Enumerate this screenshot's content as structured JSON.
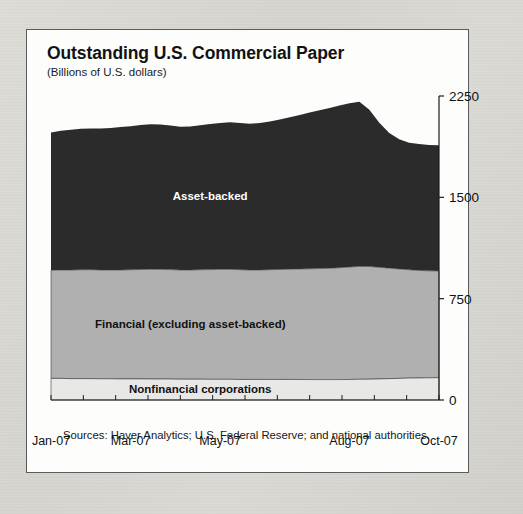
{
  "panel": {
    "title": "Outstanding U.S. Commercial Paper",
    "subtitle": "(Billions of U.S. dollars)",
    "source": "Sources: Haver Analytics; U.S. Federal Reserve; and national authorities."
  },
  "labels": {
    "asset_backed": "Asset-backed",
    "financial": "Financial (excluding asset-backed)",
    "nonfinancial": "Nonfinancial corporations"
  },
  "colors": {
    "asset_backed": "#2b2b2b",
    "financial": "#b0b0b0",
    "nonfinancial": "#e8e8e6",
    "axis": "#1d1d1d",
    "panel_background": "#fdfdfc",
    "page_background": "#d9d7d2"
  },
  "chart_data": {
    "type": "area",
    "stacked": true,
    "title": "Outstanding U.S. Commercial Paper",
    "subtitle": "(Billions of U.S. dollars)",
    "xlabel": "",
    "ylabel": "Billions of U.S. dollars",
    "ylim": [
      0,
      2250
    ],
    "yticks": [
      0,
      750,
      1500,
      2250
    ],
    "ytick_labels": [
      "0",
      "750",
      "1500",
      "2250"
    ],
    "y_axis_position": "right",
    "grid": false,
    "legend": "inline-band-labels",
    "xticks": [
      "Jan-07",
      "Mar-07",
      "May-07",
      "Aug-07",
      "Oct-07"
    ],
    "xtick_positions": [
      0,
      8,
      17,
      30,
      39
    ],
    "x": [
      "Jan-07 w1",
      "Jan-07 w2",
      "Jan-07 w3",
      "Jan-07 w4",
      "Feb-07 w1",
      "Feb-07 w2",
      "Feb-07 w3",
      "Feb-07 w4",
      "Mar-07 w1",
      "Mar-07 w2",
      "Mar-07 w3",
      "Mar-07 w4",
      "Apr-07 w1",
      "Apr-07 w2",
      "Apr-07 w3",
      "Apr-07 w4",
      "May-07 w1",
      "May-07 w2",
      "May-07 w3",
      "May-07 w4",
      "Jun-07 w1",
      "Jun-07 w2",
      "Jun-07 w3",
      "Jun-07 w4",
      "Jul-07 w1",
      "Jul-07 w2",
      "Jul-07 w3",
      "Jul-07 w4",
      "Aug-07 w1",
      "Aug-07 w2",
      "Aug-07 w3",
      "Aug-07 w4",
      "Sep-07 w1",
      "Sep-07 w2",
      "Sep-07 w3",
      "Sep-07 w4",
      "Oct-07 w1",
      "Oct-07 w2",
      "Oct-07 w3",
      "Oct-07 w4"
    ],
    "series": [
      {
        "name": "Nonfinancial corporations",
        "color": "#e8e8e6",
        "values": [
          160,
          160,
          158,
          158,
          158,
          157,
          157,
          156,
          156,
          156,
          155,
          155,
          155,
          154,
          154,
          154,
          153,
          153,
          153,
          152,
          152,
          152,
          152,
          152,
          152,
          152,
          151,
          151,
          151,
          151,
          152,
          153,
          154,
          156,
          158,
          160,
          162,
          163,
          164,
          165
        ]
      },
      {
        "name": "Financial (excluding asset-backed)",
        "color": "#b0b0b0",
        "values": [
          800,
          802,
          804,
          806,
          806,
          805,
          805,
          806,
          808,
          810,
          812,
          812,
          810,
          808,
          808,
          810,
          812,
          814,
          814,
          812,
          810,
          810,
          812,
          814,
          816,
          818,
          820,
          822,
          824,
          828,
          832,
          836,
          834,
          826,
          818,
          810,
          802,
          796,
          792,
          790
        ]
      },
      {
        "name": "Asset-backed",
        "color": "#2b2b2b",
        "values": [
          1020,
          1030,
          1038,
          1044,
          1046,
          1048,
          1052,
          1058,
          1062,
          1070,
          1074,
          1072,
          1066,
          1060,
          1062,
          1070,
          1078,
          1084,
          1088,
          1086,
          1082,
          1088,
          1098,
          1110,
          1124,
          1140,
          1156,
          1172,
          1186,
          1200,
          1212,
          1218,
          1160,
          1070,
          1000,
          960,
          940,
          935,
          932,
          930
        ]
      }
    ],
    "totals": [
      1980,
      1992,
      2000,
      2008,
      2010,
      2010,
      2014,
      2020,
      2026,
      2036,
      2041,
      2039,
      2031,
      2022,
      2024,
      2034,
      2043,
      2051,
      2055,
      2050,
      2044,
      2050,
      2062,
      2076,
      2092,
      2110,
      2127,
      2145,
      2161,
      2179,
      2196,
      2207,
      2148,
      2052,
      1976,
      1930,
      1904,
      1894,
      1888,
      1885
    ],
    "annotations": [
      {
        "text": "Asset-backed",
        "series": "Asset-backed"
      },
      {
        "text": "Financial (excluding asset-backed)",
        "series": "Financial (excluding asset-backed)"
      },
      {
        "text": "Nonfinancial corporations",
        "series": "Nonfinancial corporations"
      }
    ]
  }
}
